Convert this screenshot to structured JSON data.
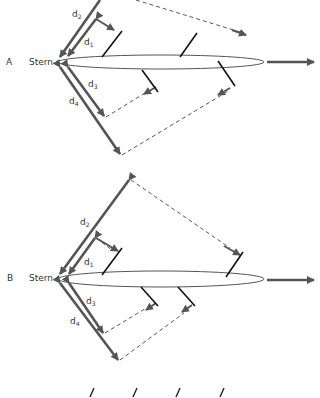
{
  "panels": [
    {
      "id": "A",
      "label": "A",
      "stern_label": "Stern",
      "distances": [
        {
          "name": "d",
          "sub": "1"
        },
        {
          "name": "d",
          "sub": "2"
        },
        {
          "name": "d",
          "sub": "3"
        },
        {
          "name": "d",
          "sub": "4"
        }
      ]
    },
    {
      "id": "B",
      "label": "B",
      "stern_label": "Stern",
      "distances": [
        {
          "name": "d",
          "sub": "1"
        },
        {
          "name": "d",
          "sub": "2"
        },
        {
          "name": "d",
          "sub": "3"
        },
        {
          "name": "d",
          "sub": "4"
        }
      ]
    }
  ],
  "colors": {
    "arrow": "#555555",
    "fin": "#111111",
    "dashed": "#444444",
    "text": "#333333"
  }
}
